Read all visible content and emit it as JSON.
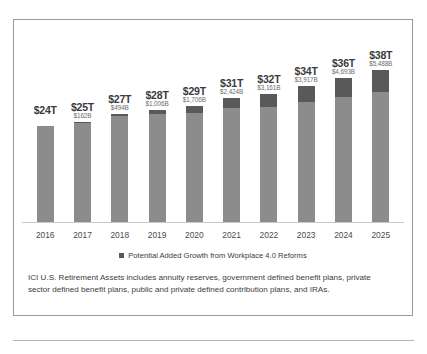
{
  "chart_data": {
    "type": "bar",
    "stacked": true,
    "title": "",
    "subtitle": "",
    "xlabel": "",
    "ylabel": "",
    "grid": false,
    "legend_position": "bottom",
    "ylim": [
      0,
      38
    ],
    "categories": [
      "2016",
      "2017",
      "2018",
      "2019",
      "2020",
      "2021",
      "2022",
      "2023",
      "2024",
      "2025"
    ],
    "series": [
      {
        "name": "U.S. Retirement Assets",
        "values": [
          24,
          25,
          27,
          28,
          29,
          31,
          32,
          34,
          36,
          38
        ],
        "color": "#8c8c8c",
        "unit": "trillion USD"
      },
      {
        "name": "Potential Added Growth from Workplace 4.0 Reforms",
        "values": [
          0,
          162,
          494,
          1006,
          1706,
          2424,
          3161,
          3917,
          4693,
          5488
        ],
        "color": "#595959",
        "unit": "billion USD"
      }
    ],
    "bars": [
      {
        "year": "2016",
        "total_label": "$24T",
        "added_label": "",
        "total_value": 24,
        "added_value": 0
      },
      {
        "year": "2017",
        "total_label": "$25T",
        "added_label": "$162B",
        "total_value": 25,
        "added_value": 162
      },
      {
        "year": "2018",
        "total_label": "$27T",
        "added_label": "$494B",
        "total_value": 27,
        "added_value": 494
      },
      {
        "year": "2019",
        "total_label": "$28T",
        "added_label": "$1,006B",
        "total_value": 28,
        "added_value": 1006
      },
      {
        "year": "2020",
        "total_label": "$29T",
        "added_label": "$1,706B",
        "total_value": 29,
        "added_value": 1706
      },
      {
        "year": "2021",
        "total_label": "$31T",
        "added_label": "$2,424B",
        "total_value": 31,
        "added_value": 2424
      },
      {
        "year": "2022",
        "total_label": "$32T",
        "added_label": "$3,161B",
        "total_value": 32,
        "added_value": 3161
      },
      {
        "year": "2023",
        "total_label": "$34T",
        "added_label": "$3,917B",
        "total_value": 34,
        "added_value": 3917
      },
      {
        "year": "2024",
        "total_label": "$36T",
        "added_label": "$4,693B",
        "total_value": 36,
        "added_value": 4693
      },
      {
        "year": "2025",
        "total_label": "$38T",
        "added_label": "$5,488B",
        "total_value": 38,
        "added_value": 5488
      }
    ]
  },
  "legend": {
    "items": [
      {
        "label": "Potential Added Growth from Workplace 4.0 Reforms",
        "color": "#595959"
      }
    ]
  },
  "footnote": {
    "text": "ICI U.S. Retirement Assets includes annuity reserves, government defined benefit plans, private sector defined benefit plans, public and private defined contribution plans, and IRAs."
  },
  "colors": {
    "base_bar": "#8c8c8c",
    "added_bar": "#595959",
    "border": "#9a9a9a",
    "text": "#3b3b3b",
    "muted_text": "#6d6d6d"
  }
}
